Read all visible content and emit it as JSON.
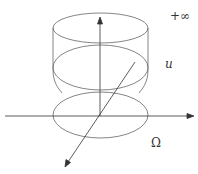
{
  "labels": {
    "plus_infinity": "+∞",
    "u": "u",
    "omega": "Ω"
  },
  "colors": {
    "stroke": "#555555",
    "background": "#ffffff"
  }
}
